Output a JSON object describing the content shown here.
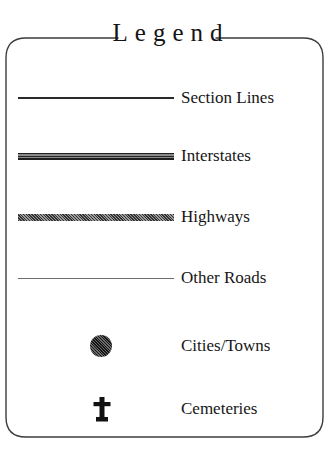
{
  "legend": {
    "title": "Legend",
    "border_color": "#3c3c3c",
    "background_color": "#ffffff",
    "text_color": "#161616",
    "entries": [
      {
        "label": "Section Lines",
        "symbol": "line-thin-dark",
        "symbol_color": "#2a2a2a"
      },
      {
        "label": "Interstates",
        "symbol": "line-cased-double",
        "symbol_color": "#1e1e1e"
      },
      {
        "label": "Highways",
        "symbol": "line-thick-halftone",
        "symbol_color": "#6f6f6f"
      },
      {
        "label": "Other Roads",
        "symbol": "line-hairline",
        "symbol_color": "#6d6d6d"
      },
      {
        "label": "Cities/Towns",
        "symbol": "filled-circle",
        "symbol_color": "#4a4a4a"
      },
      {
        "label": "Cemeteries",
        "symbol": "cross-headstone-icon",
        "symbol_color": "#111111"
      }
    ]
  }
}
